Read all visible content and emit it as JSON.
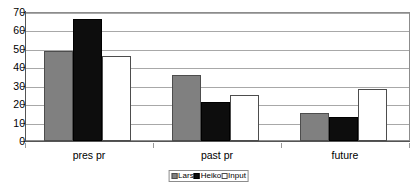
{
  "chart_data": {
    "type": "bar",
    "title": "",
    "subtitle": "",
    "xlabel": "",
    "ylabel": "",
    "categories": [
      "pres pr",
      "past pr",
      "future"
    ],
    "series": [
      {
        "name": "Lars",
        "values": [
          49,
          36,
          15
        ],
        "color": "#808080"
      },
      {
        "name": "Heiko",
        "values": [
          66,
          21,
          13
        ],
        "color": "#0d0d0d"
      },
      {
        "name": "Input",
        "values": [
          46,
          25,
          28
        ],
        "color": "#ffffff"
      }
    ],
    "ylim": [
      0,
      70
    ],
    "yticks": [
      0,
      10,
      20,
      30,
      40,
      50,
      60,
      70
    ],
    "ytick_labels": [
      "0",
      "10",
      "20",
      "30",
      "40",
      "50",
      "60",
      "70"
    ],
    "grid": true,
    "grid_axis": "y",
    "legend_position": "bottom-center",
    "bar_border_color": "#4d4d4d",
    "gridline_color": "#a8a8a8",
    "axis_color": "#555555",
    "background": "#ffffff"
  }
}
